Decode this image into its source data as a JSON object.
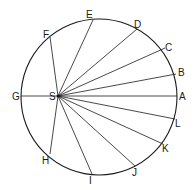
{
  "diagram": {
    "circle": {
      "cx": 99,
      "cy": 97,
      "r": 78
    },
    "focus": {
      "label": "S",
      "x": 58,
      "y": 96
    },
    "points": [
      {
        "label": "A",
        "x": 177,
        "y": 96,
        "lx": 179,
        "ly": 100
      },
      {
        "label": "B",
        "x": 176,
        "y": 74,
        "lx": 178,
        "ly": 76
      },
      {
        "label": "C",
        "x": 165,
        "y": 48,
        "lx": 165,
        "ly": 51
      },
      {
        "label": "D",
        "x": 137,
        "y": 29,
        "lx": 134,
        "ly": 28
      },
      {
        "label": "E",
        "x": 93,
        "y": 20,
        "lx": 86,
        "ly": 18
      },
      {
        "label": "F",
        "x": 50,
        "y": 37,
        "lx": 43,
        "ly": 38
      },
      {
        "label": "G",
        "x": 21,
        "y": 96,
        "lx": 12,
        "ly": 100
      },
      {
        "label": "H",
        "x": 50,
        "y": 154,
        "lx": 42,
        "ly": 164
      },
      {
        "label": "I",
        "x": 92,
        "y": 174,
        "lx": 89,
        "ly": 184
      },
      {
        "label": "J",
        "x": 135,
        "y": 166,
        "lx": 132,
        "ly": 176
      },
      {
        "label": "K",
        "x": 163,
        "y": 144,
        "lx": 162,
        "ly": 152
      },
      {
        "label": "L",
        "x": 175,
        "y": 119,
        "lx": 175,
        "ly": 127
      }
    ]
  }
}
